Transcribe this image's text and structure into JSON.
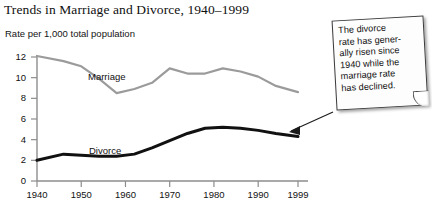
{
  "chart_data": {
    "type": "line",
    "title": "Trends in Marriage and Divorce, 1940–1999",
    "subtitle": "Rate per 1,000 total population",
    "ylabel": "",
    "xlabel": "",
    "xlim": [
      1940,
      1999
    ],
    "ylim": [
      0,
      13
    ],
    "grid": false,
    "legend": "inline-labels",
    "yticks": [
      "0",
      "2",
      "4",
      "6",
      "8",
      "10",
      "12"
    ],
    "ytick_values": [
      0,
      2,
      4,
      6,
      8,
      10,
      12
    ],
    "xticks": [
      "1940",
      "1950",
      "1960",
      "1970",
      "1980",
      "1990",
      "1999"
    ],
    "xtick_values": [
      1940,
      1950,
      1960,
      1970,
      1980,
      1990,
      1999
    ],
    "series": [
      {
        "name": "Marriage",
        "color": "#9b9b9b",
        "x": [
          1940,
          1946,
          1950,
          1954,
          1958,
          1962,
          1966,
          1970,
          1974,
          1978,
          1982,
          1986,
          1990,
          1994,
          1999
        ],
        "values": [
          12.1,
          11.6,
          11.1,
          9.9,
          8.5,
          8.9,
          9.5,
          10.9,
          10.4,
          10.4,
          10.9,
          10.6,
          10.1,
          9.2,
          8.6
        ]
      },
      {
        "name": "Divorce",
        "color": "#111111",
        "x": [
          1940,
          1946,
          1950,
          1954,
          1958,
          1962,
          1966,
          1970,
          1974,
          1978,
          1982,
          1986,
          1990,
          1994,
          1999
        ],
        "values": [
          2.0,
          2.6,
          2.5,
          2.4,
          2.4,
          2.6,
          3.2,
          3.9,
          4.6,
          5.1,
          5.2,
          5.1,
          4.9,
          4.6,
          4.3
        ]
      }
    ]
  },
  "callout": {
    "lines": [
      "The divorce",
      "rate has gener-",
      "ally risen since",
      "1940 while the",
      "marriage rate",
      "has declined."
    ]
  },
  "colors": {
    "marriage_line": "#9b9b9b",
    "divorce_line": "#111111",
    "axis": "#8d8d8d",
    "text": "#121212"
  }
}
